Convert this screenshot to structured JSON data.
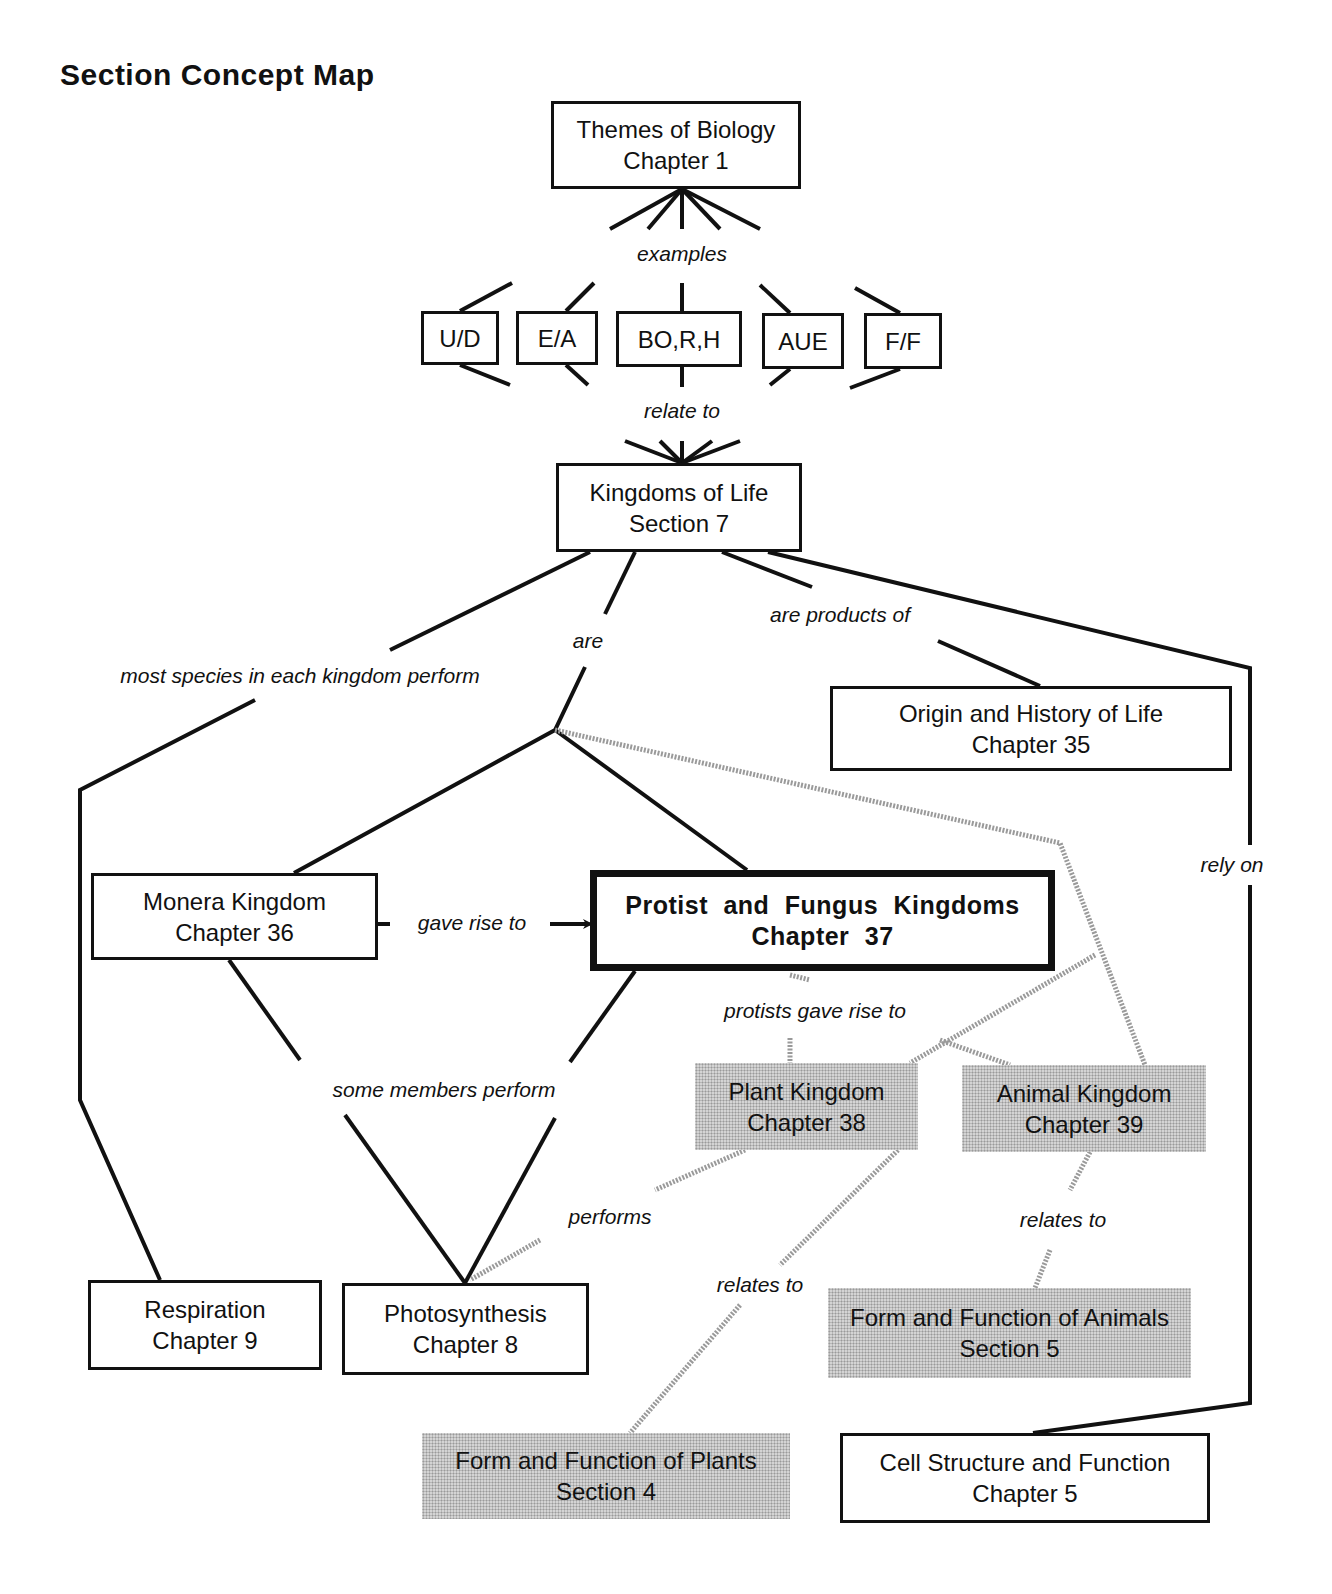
{
  "title": "Section Concept Map",
  "colors": {
    "line": "#111111",
    "shaded_fill": "#d4d4d4",
    "dotted_line": "#9a9a9a"
  },
  "nodes": [
    {
      "id": "themes",
      "lines": [
        "Themes of Biology",
        "Chapter 1"
      ],
      "x": 551,
      "y": 101,
      "w": 250,
      "h": 88,
      "style": "normal"
    },
    {
      "id": "ud",
      "lines": [
        "U/D"
      ],
      "x": 421,
      "y": 311,
      "w": 78,
      "h": 54,
      "style": "normal"
    },
    {
      "id": "ea",
      "lines": [
        "E/A"
      ],
      "x": 516,
      "y": 311,
      "w": 82,
      "h": 54,
      "style": "normal"
    },
    {
      "id": "borh",
      "lines": [
        "BO,R,H"
      ],
      "x": 616,
      "y": 311,
      "w": 126,
      "h": 56,
      "style": "normal"
    },
    {
      "id": "aue",
      "lines": [
        "AUE"
      ],
      "x": 762,
      "y": 313,
      "w": 82,
      "h": 56,
      "style": "normal"
    },
    {
      "id": "ff",
      "lines": [
        "F/F"
      ],
      "x": 864,
      "y": 313,
      "w": 78,
      "h": 56,
      "style": "normal"
    },
    {
      "id": "kingdoms",
      "lines": [
        "Kingdoms of Life",
        "Section 7"
      ],
      "x": 556,
      "y": 463,
      "w": 246,
      "h": 89,
      "style": "normal"
    },
    {
      "id": "origin",
      "lines": [
        "Origin and History of Life",
        "Chapter 35"
      ],
      "x": 830,
      "y": 686,
      "w": 402,
      "h": 85,
      "style": "normal"
    },
    {
      "id": "monera",
      "lines": [
        "Monera Kingdom",
        "Chapter 36"
      ],
      "x": 91,
      "y": 873,
      "w": 287,
      "h": 87,
      "style": "normal"
    },
    {
      "id": "protist",
      "lines": [
        "Protist and Fungus Kingdoms",
        "Chapter 37"
      ],
      "x": 590,
      "y": 870,
      "w": 465,
      "h": 101,
      "style": "bold"
    },
    {
      "id": "plant",
      "lines": [
        "Plant Kingdom",
        "Chapter 38"
      ],
      "x": 695,
      "y": 1063,
      "w": 223,
      "h": 87,
      "style": "shaded"
    },
    {
      "id": "animal",
      "lines": [
        "Animal Kingdom",
        "Chapter 39"
      ],
      "x": 962,
      "y": 1065,
      "w": 244,
      "h": 87,
      "style": "shaded"
    },
    {
      "id": "respiration",
      "lines": [
        "Respiration",
        "Chapter 9"
      ],
      "x": 88,
      "y": 1280,
      "w": 234,
      "h": 90,
      "style": "normal"
    },
    {
      "id": "photosynthesis",
      "lines": [
        "Photosynthesis",
        "Chapter 8"
      ],
      "x": 342,
      "y": 1283,
      "w": 247,
      "h": 92,
      "style": "normal"
    },
    {
      "id": "ff_animals",
      "lines": [
        "Form and Function of Animals",
        "Section 5"
      ],
      "x": 828,
      "y": 1288,
      "w": 363,
      "h": 90,
      "style": "shaded"
    },
    {
      "id": "ff_plants",
      "lines": [
        "Form and Function of Plants",
        "Section 4"
      ],
      "x": 422,
      "y": 1433,
      "w": 368,
      "h": 86,
      "style": "shaded"
    },
    {
      "id": "cell",
      "lines": [
        "Cell Structure and Function",
        "Chapter 5"
      ],
      "x": 840,
      "y": 1433,
      "w": 370,
      "h": 90,
      "style": "normal"
    }
  ],
  "links": [
    {
      "label": "examples",
      "x": 682,
      "y": 254
    },
    {
      "label": "relate to",
      "x": 682,
      "y": 411
    },
    {
      "label": "are",
      "x": 588,
      "y": 641
    },
    {
      "label": "most  species in each kingdom perform",
      "x": 300,
      "y": 676
    },
    {
      "label": "are products of",
      "x": 840,
      "y": 615
    },
    {
      "label": "rely on",
      "x": 1232,
      "y": 865
    },
    {
      "label": "gave rise to",
      "x": 472,
      "y": 923
    },
    {
      "label": "protists gave rise to",
      "x": 815,
      "y": 1011
    },
    {
      "label": "some members perform",
      "x": 444,
      "y": 1090
    },
    {
      "label": "performs",
      "x": 610,
      "y": 1217
    },
    {
      "label": "relates to",
      "x": 1063,
      "y": 1220
    },
    {
      "label": "relates to",
      "x": 760,
      "y": 1285
    }
  ],
  "solid_lines": [
    [
      [
        682,
        189
      ],
      [
        610,
        229
      ]
    ],
    [
      [
        682,
        189
      ],
      [
        648,
        229
      ]
    ],
    [
      [
        682,
        189
      ],
      [
        682,
        229
      ]
    ],
    [
      [
        682,
        189
      ],
      [
        720,
        229
      ]
    ],
    [
      [
        682,
        189
      ],
      [
        760,
        229
      ]
    ],
    [
      [
        460,
        311
      ],
      [
        512,
        283
      ]
    ],
    [
      [
        566,
        311
      ],
      [
        594,
        283
      ]
    ],
    [
      [
        682,
        311
      ],
      [
        682,
        283
      ]
    ],
    [
      [
        790,
        313
      ],
      [
        760,
        285
      ]
    ],
    [
      [
        900,
        313
      ],
      [
        855,
        288
      ]
    ],
    [
      [
        460,
        365
      ],
      [
        510,
        385
      ]
    ],
    [
      [
        566,
        365
      ],
      [
        588,
        385
      ]
    ],
    [
      [
        682,
        367
      ],
      [
        682,
        387
      ]
    ],
    [
      [
        790,
        369
      ],
      [
        770,
        385
      ]
    ],
    [
      [
        900,
        369
      ],
      [
        850,
        388
      ]
    ],
    [
      [
        682,
        463
      ],
      [
        625,
        441
      ]
    ],
    [
      [
        682,
        463
      ],
      [
        660,
        441
      ]
    ],
    [
      [
        682,
        463
      ],
      [
        682,
        441
      ]
    ],
    [
      [
        682,
        463
      ],
      [
        712,
        441
      ]
    ],
    [
      [
        682,
        463
      ],
      [
        740,
        441
      ]
    ],
    [
      [
        590,
        552
      ],
      [
        390,
        650
      ]
    ],
    [
      [
        255,
        700
      ],
      [
        80,
        790
      ],
      [
        80,
        1100
      ],
      [
        160,
        1280
      ]
    ],
    [
      [
        635,
        552
      ],
      [
        605,
        614
      ]
    ],
    [
      [
        585,
        667
      ],
      [
        555,
        730
      ],
      [
        294,
        873
      ]
    ],
    [
      [
        555,
        730
      ],
      [
        747,
        870
      ]
    ],
    [
      [
        722,
        552
      ],
      [
        812,
        587
      ]
    ],
    [
      [
        938,
        641
      ],
      [
        1040,
        686
      ]
    ],
    [
      [
        768,
        552
      ],
      [
        1250,
        668
      ],
      [
        1250,
        845
      ]
    ],
    [
      [
        1250,
        885
      ],
      [
        1250,
        1403
      ],
      [
        1033,
        1433
      ]
    ],
    [
      [
        229,
        960
      ],
      [
        300,
        1060
      ]
    ],
    [
      [
        345,
        1115
      ],
      [
        465,
        1283
      ]
    ],
    [
      [
        635,
        971
      ],
      [
        570,
        1062
      ]
    ],
    [
      [
        555,
        1118
      ],
      [
        465,
        1283
      ]
    ],
    [
      [
        378,
        924
      ],
      [
        390,
        924
      ]
    ],
    [
      [
        550,
        924
      ],
      [
        588,
        924
      ]
    ]
  ],
  "dotted_lines": [
    [
      [
        555,
        730
      ],
      [
        1060,
        843
      ],
      [
        1145,
        1065
      ]
    ],
    [
      [
        1095,
        955
      ],
      [
        910,
        1063
      ]
    ],
    [
      [
        940,
        1040
      ],
      [
        1010,
        1065
      ]
    ],
    [
      [
        790,
        975
      ],
      [
        810,
        980
      ]
    ],
    [
      [
        790,
        1038
      ],
      [
        790,
        1063
      ]
    ],
    [
      [
        745,
        1150
      ],
      [
        655,
        1190
      ]
    ],
    [
      [
        540,
        1240
      ],
      [
        470,
        1280
      ]
    ],
    [
      [
        898,
        1150
      ],
      [
        780,
        1265
      ]
    ],
    [
      [
        740,
        1305
      ],
      [
        630,
        1433
      ]
    ],
    [
      [
        1090,
        1152
      ],
      [
        1070,
        1190
      ]
    ],
    [
      [
        1050,
        1250
      ],
      [
        1035,
        1288
      ]
    ]
  ]
}
